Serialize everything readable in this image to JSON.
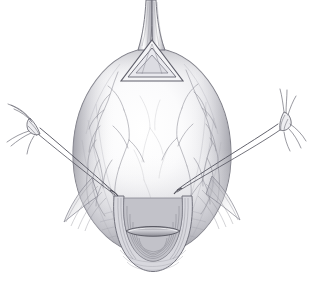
{
  "figure": {
    "medium": "graphite pencil line drawing with gray wash shading",
    "background_color": "#ffffff",
    "ink_color": "#4a4a4a",
    "shadow_color": "#9a9aa0",
    "highlight_color": "#fdfdfd",
    "midtone_color": "#c8c8cc",
    "vessel_color": "#8b8b93",
    "caption": "Uterine body shown in anterior view; a triangular opening at the fundus, vascular serosal surface, everted cervical os below, and paired lateral traction sutures tied off to each side.",
    "canvas": {
      "width": 315,
      "height": 286
    }
  },
  "parts": {
    "fundus_tube": {
      "label": "Fundal tubular stalk",
      "name": "fundus-tubular-stalk",
      "description": "Two parallel lines rising from the fundus off the top edge of the frame"
    },
    "apex_triangle": {
      "label": "Triangular fundal opening",
      "name": "apex-triangle",
      "description": "Inverted-V triangular window outlined in double line at the top of the uterine body"
    },
    "uterine_body": {
      "label": "Uterine body",
      "name": "uterine-body",
      "description": "Large ovoid mass occupying the centre of the frame, shaded darker at the left and right margins"
    },
    "vascular_network": {
      "label": "Serosal vessels",
      "name": "vascular-network",
      "description": "Branching fine vessel lines tracking over the left and right shoulders of the body"
    },
    "cervix": {
      "label": "Cervix and external os",
      "name": "cervix-external-os",
      "description": "Everted cuff with concentric rings and a transverse slit-like os at the lower midline"
    },
    "left_suture": {
      "label": "Left traction suture",
      "name": "left-traction-suture",
      "description": "Double thread running from the left lateral uterine wall up and out to a knot near the left margin, with free tails fanned out"
    },
    "right_suture": {
      "label": "Right traction suture",
      "name": "right-traction-suture",
      "description": "Double thread running from the right lateral uterine wall up and out to a knot near the right margin, with free tails fanned out"
    },
    "left_flap": {
      "label": "Left tissue flap",
      "name": "left-tissue-flap",
      "description": "Wing-like fold of tissue sweeping down and left from the lower uterine segment"
    },
    "right_flap": {
      "label": "Right tissue flap",
      "name": "right-tissue-flap",
      "description": "Wing-like fold of tissue sweeping down and right from the lower uterine segment"
    }
  },
  "geometry": {
    "body_center_x": 152,
    "body_center_y": 155,
    "body_radius_x": 78,
    "body_radius_y": 105,
    "apex_y": 52,
    "os_y": 248,
    "left_knot": {
      "x": 32,
      "y": 124
    },
    "right_knot": {
      "x": 284,
      "y": 120
    },
    "left_anchor": {
      "x": 113,
      "y": 192
    },
    "right_anchor": {
      "x": 178,
      "y": 190
    }
  }
}
